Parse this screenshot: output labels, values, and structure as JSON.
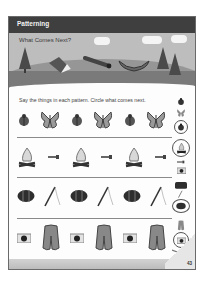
{
  "header": {
    "section": "Patterning"
  },
  "banner": {
    "title": "What Comes Next?"
  },
  "instructions": "Say the things in each pattern. Circle what comes next.",
  "rows": [
    {
      "pattern": [
        "ladybug",
        "butterfly",
        "ladybug",
        "butterfly",
        "ladybug",
        "butterfly"
      ],
      "choices": [
        "ladybug",
        "butterfly",
        "ladybug"
      ],
      "circled": 2
    },
    {
      "pattern": [
        "campfire",
        "flashlight",
        "campfire",
        "flashlight",
        "campfire",
        "flashlight"
      ],
      "choices": [
        "campfire",
        "flashlight",
        "camera"
      ],
      "circled": 0
    },
    {
      "pattern": [
        "sleeping-bag",
        "fishing-rod",
        "sleeping-bag",
        "fishing-rod",
        "sleeping-bag",
        "fishing-rod"
      ],
      "choices": [
        "tent-bag",
        "fishing-rod",
        "sleeping-bag"
      ],
      "circled": 2
    },
    {
      "pattern": [
        "camera",
        "life-vest",
        "camera",
        "life-vest",
        "camera",
        "life-vest"
      ],
      "choices": [
        "life-vest",
        "camera",
        "paddle"
      ],
      "circled": 1
    }
  ],
  "page_number": "43",
  "colors": {
    "header": "#3f3f3f",
    "banner_sky": "#bdbdbd",
    "ground": "#7a7a7a",
    "border": "#6a6a6a"
  }
}
